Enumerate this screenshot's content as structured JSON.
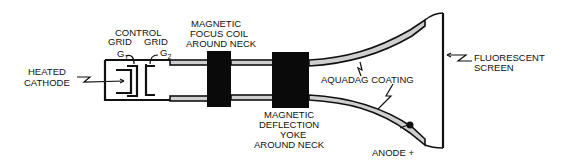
{
  "diagram": {
    "labels": {
      "heated_cathode": [
        "HEATED",
        "CATHODE"
      ],
      "control_grid": [
        "CONTROL",
        "GRID"
      ],
      "grid": "GRID",
      "g1": "G",
      "g1_sub": "1",
      "g2": "G",
      "g2_sub": "2",
      "focus_coil": [
        "MAGNETIC",
        "FOCUS COIL",
        "AROUND NECK"
      ],
      "deflection_yoke": [
        "MAGNETIC",
        "DEFLECTION",
        "YOKE",
        "AROUND NECK"
      ],
      "aquadag": "AQUADAG COATING",
      "fluorescent_screen": [
        "FLUORESCENT",
        "SCREEN"
      ],
      "anode": "ANODE +"
    },
    "colors": {
      "ink": "#111111",
      "background": "#ffffff",
      "coating": "#cfcfcf"
    }
  }
}
